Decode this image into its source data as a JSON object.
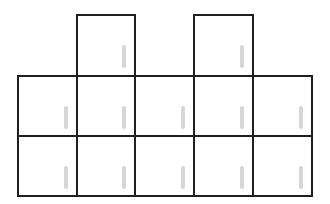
{
  "diagram": {
    "colors": {
      "stroke": "#1f1f1f",
      "handle": "#d6d6d6",
      "background": "#ffffff"
    },
    "grid": {
      "columns_x": [
        18,
        77,
        135,
        194,
        253,
        312
      ],
      "rows_y": [
        15,
        76,
        136,
        196
      ]
    },
    "cells": [
      {
        "row": 0,
        "col": 1
      },
      {
        "row": 0,
        "col": 3
      },
      {
        "row": 1,
        "col": 0
      },
      {
        "row": 1,
        "col": 1
      },
      {
        "row": 1,
        "col": 2
      },
      {
        "row": 1,
        "col": 3
      },
      {
        "row": 1,
        "col": 4
      },
      {
        "row": 2,
        "col": 0
      },
      {
        "row": 2,
        "col": 1
      },
      {
        "row": 2,
        "col": 2
      },
      {
        "row": 2,
        "col": 3
      },
      {
        "row": 2,
        "col": 4
      }
    ]
  }
}
